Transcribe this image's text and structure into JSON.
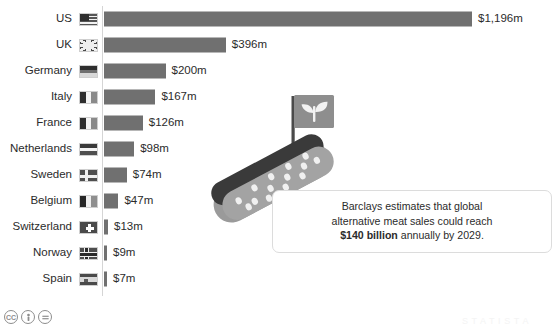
{
  "chart_data": {
    "type": "bar",
    "orientation": "horizontal",
    "title": "",
    "subtitle": "",
    "xlabel": "",
    "ylabel": "",
    "unit": "USD millions",
    "grid": false,
    "legend": "none",
    "xlim": [
      0,
      1196
    ],
    "categories": [
      "US",
      "UK",
      "Germany",
      "Italy",
      "France",
      "Netherlands",
      "Sweden",
      "Belgium",
      "Switzerland",
      "Norway",
      "Spain"
    ],
    "values": [
      1196,
      396,
      200,
      167,
      126,
      98,
      74,
      47,
      13,
      9,
      7
    ],
    "value_labels": [
      "$1,196m",
      "$396m",
      "$200m",
      "$167m",
      "$126m",
      "$98m",
      "$74m",
      "$47m",
      "$13m",
      "$9m",
      "$7m"
    ],
    "flag_icons": [
      "flag-us-icon",
      "flag-uk-icon",
      "flag-germany-icon",
      "flag-italy-icon",
      "flag-france-icon",
      "flag-netherlands-icon",
      "flag-sweden-icon",
      "flag-belgium-icon",
      "flag-switzerland-icon",
      "flag-norway-icon",
      "flag-spain-icon"
    ],
    "bar_color": "#707070",
    "text_color": "#2b2b2b",
    "axis_color": "#d5d5d5"
  },
  "rows": [
    {
      "label": "US",
      "value": "$1,196m",
      "num": 1196,
      "flag": "f-us",
      "icon": "flag-us-icon"
    },
    {
      "label": "UK",
      "value": "$396m",
      "num": 396,
      "flag": "f-uk",
      "icon": "flag-uk-icon"
    },
    {
      "label": "Germany",
      "value": "$200m",
      "num": 200,
      "flag": "f-de",
      "icon": "flag-germany-icon"
    },
    {
      "label": "Italy",
      "value": "$167m",
      "num": 167,
      "flag": "f-it",
      "icon": "flag-italy-icon"
    },
    {
      "label": "France",
      "value": "$126m",
      "num": 126,
      "flag": "f-fr",
      "icon": "flag-france-icon"
    },
    {
      "label": "Netherlands",
      "value": "$98m",
      "num": 98,
      "flag": "f-nl",
      "icon": "flag-netherlands-icon"
    },
    {
      "label": "Sweden",
      "value": "$74m",
      "num": 74,
      "flag": "f-se",
      "icon": "flag-sweden-icon"
    },
    {
      "label": "Belgium",
      "value": "$47m",
      "num": 47,
      "flag": "f-be",
      "icon": "flag-belgium-icon"
    },
    {
      "label": "Switzerland",
      "value": "$13m",
      "num": 13,
      "flag": "f-ch",
      "icon": "flag-switzerland-icon"
    },
    {
      "label": "Norway",
      "value": "$9m",
      "num": 9,
      "flag": "f-no",
      "icon": "flag-norway-icon"
    },
    {
      "label": "Spain",
      "value": "$7m",
      "num": 7,
      "flag": "f-es",
      "icon": "flag-spain-icon"
    }
  ],
  "callout": {
    "line1": "Barclays estimates that global",
    "line2": "alternative meat sales could reach",
    "amount": "$140 billion",
    "line3_tail": " annually by 2029."
  },
  "illustration": {
    "name": "hot-dog-with-plant-flag-illustration",
    "flag_icon": "plant-sprout-icon",
    "bun_color": "#9a9a9a",
    "sausage_color": "#3a3a3a",
    "flag_color": "#8e8e8e"
  },
  "footer": {
    "license_icons": [
      "cc-icon",
      "by-icon",
      "nd-icon"
    ],
    "cc_label": "CC",
    "by_label": "BY",
    "nd_label": "ND"
  }
}
